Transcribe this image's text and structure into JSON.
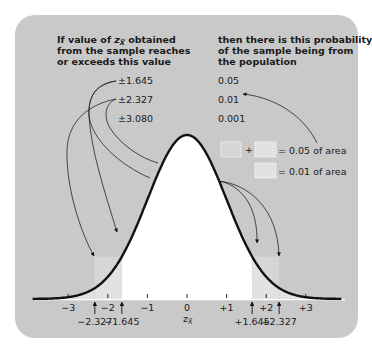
{
  "left_header": [
    "If value of z̅x obtained",
    "from the sample reaches",
    "or exceeds this value"
  ],
  "left_header_parts": {
    "line1_a": "If value of ",
    "line1_z": "z",
    "line1_sub": "X̅",
    "line1_b": " obtained",
    "line2": "from the sample reaches",
    "line3": "or exceeds this value"
  },
  "right_header": [
    "then there is this probability",
    "of the sample being from",
    "the population"
  ],
  "critical_values": [
    "±1.645",
    "±2.327",
    "±3.080"
  ],
  "probabilities": [
    "0.05",
    "0.01",
    "0.001"
  ],
  "legend": {
    "plus": "+",
    "row1_label": "= 0.05 of area",
    "row2_label": "= 0.01 of area"
  },
  "axis": {
    "label_z": "z",
    "label_sub": "X̅",
    "ticks": [
      "−3",
      "−2",
      "−1",
      "0",
      "+1",
      "+2",
      "+3"
    ],
    "markers": [
      "−2.327",
      "−1.645",
      "+1.645",
      "+2.327"
    ]
  },
  "colors": {
    "page_bg": "#ffffff",
    "panel_bg": "#c9c9c9",
    "curve_fill": "#ffffff",
    "tail_005": "#d9d9d9",
    "tail_001": "#e6e6e6",
    "curve_stroke": "#111111",
    "text": "#1a1a1a"
  },
  "chart_data": {
    "type": "area",
    "xlabel": "z̅x",
    "ylabel": "",
    "x_ticks": [
      -3,
      -2,
      -1,
      0,
      1,
      2,
      3
    ],
    "xlim": [
      -3.9,
      3.9
    ],
    "critical_values": [
      {
        "z": 1.645,
        "two_tailed_p": 0.05
      },
      {
        "z": 2.327,
        "two_tailed_p": 0.01
      },
      {
        "z": 3.08,
        "two_tailed_p": 0.001
      }
    ],
    "shaded_regions": [
      {
        "from": -2.327,
        "to": -1.645,
        "meaning": "part of 0.05 area"
      },
      {
        "from": 1.645,
        "to": 2.327,
        "meaning": "part of 0.05 area"
      },
      {
        "from": -3.9,
        "to": -2.327,
        "meaning": "0.01 of area"
      },
      {
        "from": 2.327,
        "to": 3.9,
        "meaning": "0.01 of area"
      }
    ],
    "legend": [
      "light shade + dotted shade = 0.05 of area",
      "dotted shade = 0.01 of area"
    ]
  }
}
